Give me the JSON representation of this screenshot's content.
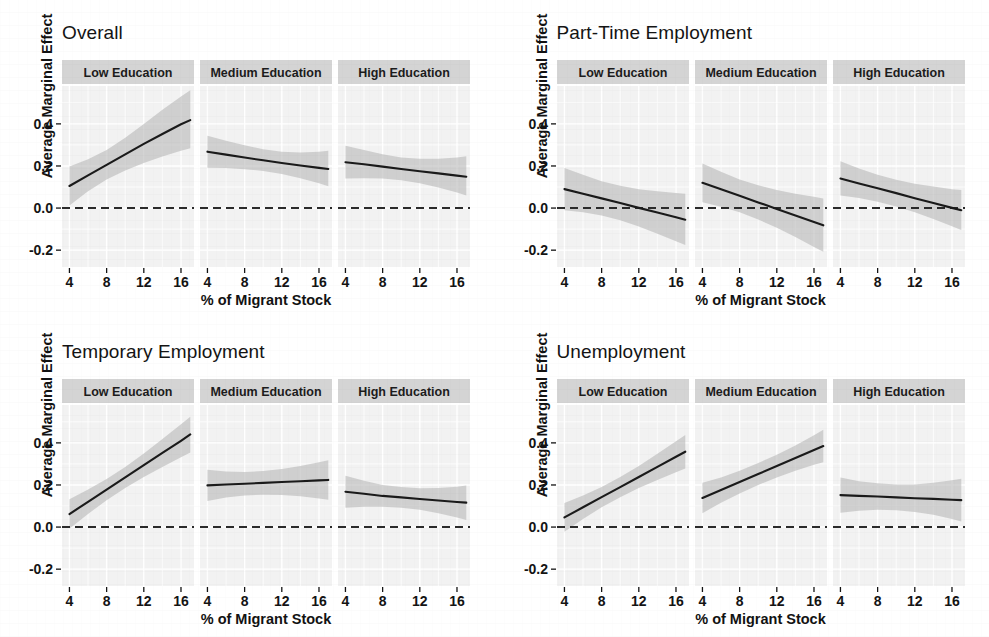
{
  "figure": {
    "background_color": "#ffffff",
    "panel_background_color": "#f2f2f2",
    "strip_background_color": "#d4d4d4",
    "gridline_color": "#ffffff",
    "line_color": "#1a1a1a",
    "ribbon_color": "#b9b9b9",
    "zero_line_color": "#2b2b2b",
    "axis_text_color": "#141414"
  },
  "axes": {
    "xlabel": "% of Migrant Stock",
    "ylabel": "Average Marginal Effect",
    "xticks": [
      "4",
      "8",
      "12",
      "16"
    ],
    "xtick_values": [
      4,
      8,
      12,
      16
    ],
    "yticks": [
      "0.4",
      "0.2",
      "0.0",
      "-0.2"
    ],
    "ytick_values": [
      0.4,
      0.2,
      0.0,
      -0.2
    ],
    "xlim": [
      3.2,
      17.4
    ],
    "ylim": [
      -0.28,
      0.58
    ],
    "zero_reference_line": 0.0
  },
  "strips": {
    "low": "Low Education",
    "medium": "Medium Education",
    "high": "High Education"
  },
  "chart_data": {
    "type": "line",
    "xlabel": "% of Migrant Stock",
    "ylabel": "Average Marginal Effect",
    "xlim": [
      3.2,
      17.4
    ],
    "ylim": [
      -0.28,
      0.58
    ],
    "xticks": [
      4,
      8,
      12,
      16
    ],
    "yticks": [
      -0.2,
      0.0,
      0.2,
      0.4
    ],
    "grid": true,
    "legend": "none",
    "annotations": [
      "dashed horizontal reference line at y = 0.0"
    ],
    "facet_rows": [
      "Overall",
      "Part-Time Employment",
      "Temporary Employment",
      "Unemployment"
    ],
    "facet_cols": [
      "Low Education",
      "Medium Education",
      "High Education"
    ],
    "panels": [
      {
        "row": "Overall",
        "col": "Low Education",
        "x": [
          4,
          6,
          8,
          10,
          12,
          14,
          16,
          17
        ],
        "estimate": [
          0.105,
          0.155,
          0.205,
          0.255,
          0.305,
          0.352,
          0.398,
          0.418
        ],
        "ci_lower": [
          0.012,
          0.08,
          0.136,
          0.178,
          0.214,
          0.245,
          0.272,
          0.284
        ],
        "ci_upper": [
          0.198,
          0.232,
          0.276,
          0.334,
          0.4,
          0.467,
          0.53,
          0.56
        ]
      },
      {
        "row": "Overall",
        "col": "Medium Education",
        "x": [
          4,
          6,
          8,
          10,
          12,
          14,
          16,
          17
        ],
        "estimate": [
          0.268,
          0.254,
          0.24,
          0.227,
          0.214,
          0.202,
          0.191,
          0.186
        ],
        "ci_lower": [
          0.192,
          0.19,
          0.185,
          0.176,
          0.162,
          0.142,
          0.118,
          0.104
        ],
        "ci_upper": [
          0.344,
          0.32,
          0.298,
          0.28,
          0.268,
          0.264,
          0.268,
          0.272
        ]
      },
      {
        "row": "Overall",
        "col": "High Education",
        "x": [
          4,
          6,
          8,
          10,
          12,
          14,
          16,
          17
        ],
        "estimate": [
          0.218,
          0.208,
          0.197,
          0.186,
          0.175,
          0.165,
          0.154,
          0.149
        ],
        "ci_lower": [
          0.14,
          0.142,
          0.14,
          0.132,
          0.118,
          0.098,
          0.074,
          0.06
        ],
        "ci_upper": [
          0.296,
          0.276,
          0.256,
          0.24,
          0.234,
          0.234,
          0.24,
          0.246
        ]
      },
      {
        "row": "Part-Time Employment",
        "col": "Low Education",
        "x": [
          4,
          6,
          8,
          10,
          12,
          14,
          16,
          17
        ],
        "estimate": [
          0.09,
          0.068,
          0.046,
          0.024,
          0.001,
          -0.021,
          -0.044,
          -0.055
        ],
        "ci_lower": [
          -0.01,
          -0.02,
          -0.035,
          -0.058,
          -0.088,
          -0.122,
          -0.158,
          -0.176
        ],
        "ci_upper": [
          0.19,
          0.158,
          0.128,
          0.106,
          0.09,
          0.08,
          0.072,
          0.068
        ]
      },
      {
        "row": "Part-Time Employment",
        "col": "Medium Education",
        "x": [
          4,
          6,
          8,
          10,
          12,
          14,
          16,
          17
        ],
        "estimate": [
          0.12,
          0.089,
          0.058,
          0.027,
          -0.004,
          -0.035,
          -0.066,
          -0.082
        ],
        "ci_lower": [
          0.028,
          0.006,
          -0.02,
          -0.054,
          -0.094,
          -0.138,
          -0.185,
          -0.208
        ],
        "ci_upper": [
          0.212,
          0.172,
          0.136,
          0.108,
          0.086,
          0.068,
          0.054,
          0.046
        ]
      },
      {
        "row": "Part-Time Employment",
        "col": "High Education",
        "x": [
          4,
          6,
          8,
          10,
          12,
          14,
          16,
          17
        ],
        "estimate": [
          0.14,
          0.117,
          0.094,
          0.071,
          0.047,
          0.024,
          0.001,
          -0.01
        ],
        "ci_lower": [
          0.06,
          0.048,
          0.03,
          0.008,
          -0.02,
          -0.052,
          -0.086,
          -0.104
        ],
        "ci_upper": [
          0.222,
          0.188,
          0.158,
          0.134,
          0.116,
          0.102,
          0.09,
          0.086
        ]
      },
      {
        "row": "Temporary Employment",
        "col": "Low Education",
        "x": [
          4,
          6,
          8,
          10,
          12,
          14,
          16,
          17
        ],
        "estimate": [
          0.062,
          0.12,
          0.178,
          0.236,
          0.294,
          0.352,
          0.41,
          0.44
        ],
        "ci_lower": [
          -0.008,
          0.062,
          0.128,
          0.186,
          0.238,
          0.286,
          0.332,
          0.354
        ],
        "ci_upper": [
          0.132,
          0.178,
          0.228,
          0.286,
          0.35,
          0.418,
          0.488,
          0.524
        ]
      },
      {
        "row": "Temporary Employment",
        "col": "Medium Education",
        "x": [
          4,
          6,
          8,
          10,
          12,
          14,
          16,
          17
        ],
        "estimate": [
          0.198,
          0.202,
          0.206,
          0.21,
          0.214,
          0.218,
          0.222,
          0.224
        ],
        "ci_lower": [
          0.124,
          0.14,
          0.15,
          0.154,
          0.152,
          0.146,
          0.136,
          0.13
        ],
        "ci_upper": [
          0.272,
          0.264,
          0.262,
          0.266,
          0.276,
          0.29,
          0.308,
          0.318
        ]
      },
      {
        "row": "Temporary Employment",
        "col": "High Education",
        "x": [
          4,
          6,
          8,
          10,
          12,
          14,
          16,
          17
        ],
        "estimate": [
          0.168,
          0.158,
          0.148,
          0.141,
          0.133,
          0.126,
          0.119,
          0.116
        ],
        "ci_lower": [
          0.092,
          0.096,
          0.096,
          0.092,
          0.082,
          0.066,
          0.046,
          0.034
        ],
        "ci_upper": [
          0.244,
          0.22,
          0.2,
          0.19,
          0.184,
          0.186,
          0.192,
          0.198
        ]
      },
      {
        "row": "Unemployment",
        "col": "Low Education",
        "x": [
          4,
          6,
          8,
          10,
          12,
          14,
          16,
          17
        ],
        "estimate": [
          0.046,
          0.094,
          0.142,
          0.19,
          0.238,
          0.286,
          0.334,
          0.358
        ],
        "ci_lower": [
          -0.022,
          0.038,
          0.094,
          0.142,
          0.186,
          0.224,
          0.26,
          0.278
        ],
        "ci_upper": [
          0.114,
          0.15,
          0.19,
          0.238,
          0.29,
          0.348,
          0.408,
          0.438
        ]
      },
      {
        "row": "Unemployment",
        "col": "Medium Education",
        "x": [
          4,
          6,
          8,
          10,
          12,
          14,
          16,
          17
        ],
        "estimate": [
          0.138,
          0.176,
          0.214,
          0.252,
          0.29,
          0.328,
          0.366,
          0.385
        ],
        "ci_lower": [
          0.066,
          0.116,
          0.16,
          0.2,
          0.236,
          0.268,
          0.296,
          0.308
        ],
        "ci_upper": [
          0.21,
          0.236,
          0.268,
          0.304,
          0.344,
          0.388,
          0.436,
          0.462
        ]
      },
      {
        "row": "Unemployment",
        "col": "High Education",
        "x": [
          4,
          6,
          8,
          10,
          12,
          14,
          16,
          17
        ],
        "estimate": [
          0.152,
          0.148,
          0.145,
          0.141,
          0.137,
          0.134,
          0.13,
          0.128
        ],
        "ci_lower": [
          0.068,
          0.078,
          0.082,
          0.08,
          0.072,
          0.058,
          0.038,
          0.026
        ],
        "ci_upper": [
          0.236,
          0.218,
          0.208,
          0.202,
          0.202,
          0.21,
          0.222,
          0.23
        ]
      }
    ]
  }
}
